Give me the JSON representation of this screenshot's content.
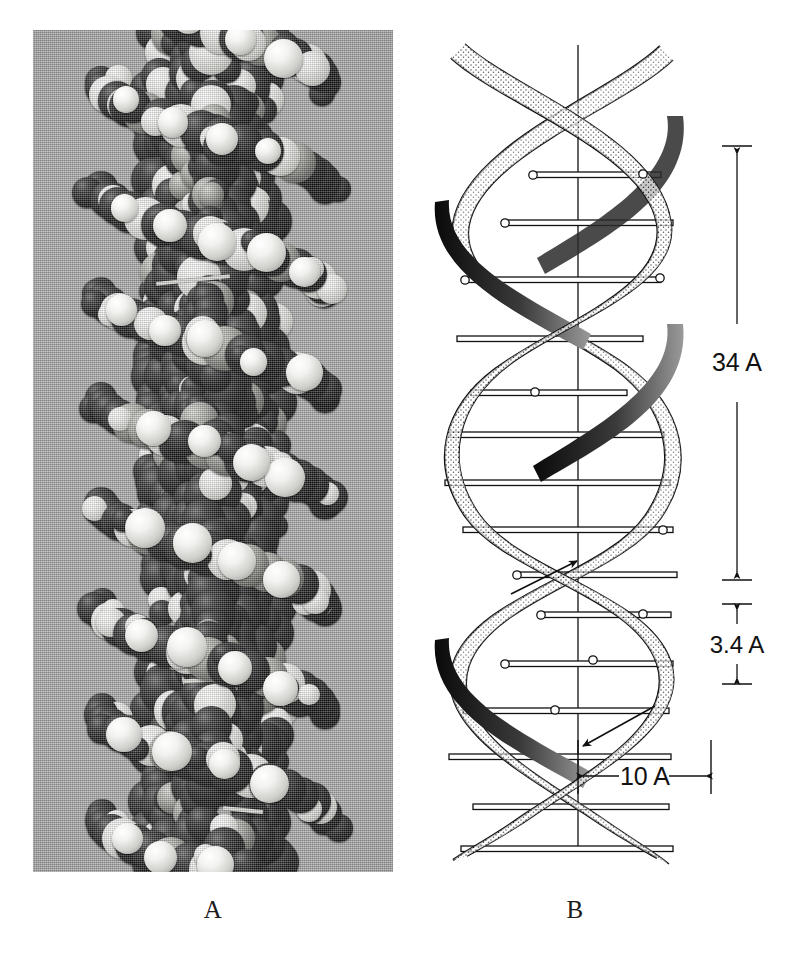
{
  "figure": {
    "kind": "scientific-figure",
    "panels": [
      {
        "id": "A",
        "caption": "A",
        "type": "photograph",
        "description": "Space-filling molecular model of DNA photographed against a gray background",
        "background_color": "#a9a9a9"
      },
      {
        "id": "B",
        "caption": "B",
        "type": "line-diagram",
        "description": "Schematic ribbon drawing of the DNA double helix with dimensions"
      }
    ]
  },
  "diagram": {
    "axis_label": "helix-axis",
    "ribbon_fill": "#ffffff",
    "ink_color": "#111111",
    "dimensions": [
      {
        "id": "pitch",
        "label": "34 A",
        "orientation": "vertical",
        "meaning": "full turn of the helix"
      },
      {
        "id": "rise",
        "label": "3.4 A",
        "orientation": "vertical",
        "meaning": "distance between adjacent base pairs"
      },
      {
        "id": "diameter",
        "label": "10 A",
        "orientation": "horizontal",
        "meaning": "helix radius marker"
      }
    ],
    "arrows": [
      {
        "id": "strand-direction-up",
        "label": "ascending strand direction"
      },
      {
        "id": "strand-direction-down",
        "label": "descending strand direction"
      }
    ],
    "base_pair_rung_count": 15,
    "sugar_marker_count": 12
  },
  "captions": {
    "a": "A",
    "b": "B"
  }
}
